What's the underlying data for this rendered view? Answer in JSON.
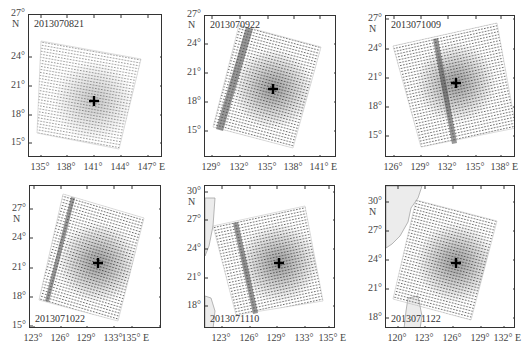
{
  "figure": {
    "panels": [
      {
        "id": "p1",
        "date": "2013070821",
        "date_pos": "top-left",
        "frame": {
          "left": 28,
          "top": 14,
          "width": 134,
          "height": 143
        },
        "y_ticks": [
          "27°",
          "24°",
          "21°",
          "18°",
          "15°"
        ],
        "y_tick_pos": [
          8,
          51,
          80,
          109,
          137
        ],
        "n_label": "N",
        "x_ticks": [
          "135°",
          "138°",
          "141°",
          "144°",
          "147°"
        ],
        "x_tick_pos": [
          40,
          66,
          93,
          120,
          147
        ],
        "e_label": "E",
        "swath": [
          [
            40,
            40
          ],
          [
            140,
            58
          ],
          [
            118,
            148
          ],
          [
            36,
            132
          ]
        ],
        "stripe": null,
        "center": [
          93,
          100
        ],
        "land": null
      },
      {
        "id": "p2",
        "date": "2013070922",
        "date_pos": "top-left",
        "frame": {
          "left": 204,
          "top": 15,
          "width": 132,
          "height": 142
        },
        "y_ticks": [
          "27°",
          "24°",
          "21°",
          "18°",
          "15°"
        ],
        "y_tick_pos": [
          9,
          38,
          67,
          96,
          125
        ],
        "n_label": "N",
        "x_ticks": [
          "129°",
          "132°",
          "135°",
          "138°",
          "141°"
        ],
        "x_tick_pos": [
          211,
          239,
          267,
          293,
          319
        ],
        "e_label": "E",
        "swath": [
          [
            238,
            24
          ],
          [
            320,
            46
          ],
          [
            292,
            147
          ],
          [
            212,
            126
          ]
        ],
        "stripe": [
          [
            245,
            26
          ],
          [
            252,
            28
          ],
          [
            222,
            130
          ],
          [
            215,
            128
          ]
        ],
        "center": [
          272,
          88
        ],
        "land": null
      },
      {
        "id": "p3",
        "date": "2013071009",
        "date_pos": "top-left",
        "frame": {
          "left": 385,
          "top": 15,
          "width": 130,
          "height": 142
        },
        "y_ticks": [
          "27°",
          "24°",
          "21°",
          "18°",
          "15°"
        ],
        "y_tick_pos": [
          13,
          43,
          72,
          101,
          130
        ],
        "n_label": "N",
        "x_ticks": [
          "126°",
          "129°",
          "132°",
          "135°",
          "138°"
        ],
        "x_tick_pos": [
          393,
          420,
          447,
          475,
          500
        ],
        "e_label": "E",
        "swath": [
          [
            392,
            45
          ],
          [
            496,
            22
          ],
          [
            515,
            127
          ],
          [
            420,
            146
          ]
        ],
        "stripe": [
          [
            432,
            38
          ],
          [
            437,
            37
          ],
          [
            456,
            142
          ],
          [
            451,
            143
          ]
        ],
        "center": [
          455,
          82
        ],
        "land": null
      },
      {
        "id": "p4",
        "date": "2013071022",
        "date_pos": "bottom-left",
        "frame": {
          "left": 29,
          "top": 185,
          "width": 132,
          "height": 143
        },
        "y_ticks": [
          "27°",
          "24°",
          "21°",
          "18°",
          "15°"
        ],
        "y_tick_pos": [
          203,
          232,
          262,
          291,
          320
        ],
        "n_label": "N",
        "x_ticks": [
          "123°",
          "126°",
          "129°",
          "133°",
          "135°"
        ],
        "x_tick_pos": [
          33,
          60,
          86,
          113,
          131
        ],
        "e_label": "E",
        "swath": [
          [
            62,
            193
          ],
          [
            143,
            217
          ],
          [
            117,
            320
          ],
          [
            38,
            299
          ]
        ],
        "stripe": [
          [
            70,
            196
          ],
          [
            74,
            197
          ],
          [
            48,
            301
          ],
          [
            44,
            300
          ]
        ],
        "center": [
          97,
          262
        ],
        "land": null
      },
      {
        "id": "p5",
        "date": "2013071110",
        "date_pos": "bottom-left",
        "frame": {
          "left": 204,
          "top": 185,
          "width": 131,
          "height": 143
        },
        "y_ticks": [
          "30°",
          "27°",
          "24°",
          "21°",
          "18°"
        ],
        "y_tick_pos": [
          186,
          214,
          243,
          272,
          300
        ],
        "n_label": "N",
        "x_ticks": [
          "123°",
          "126°",
          "129°",
          "133°",
          "135°"
        ],
        "x_tick_pos": [
          221,
          249,
          276,
          304,
          328
        ],
        "e_label": "E",
        "swath": [
          [
            212,
            225
          ],
          [
            304,
            205
          ],
          [
            322,
            300
          ],
          [
            235,
            314
          ]
        ],
        "stripe": [
          [
            232,
            222
          ],
          [
            237,
            221
          ],
          [
            257,
            312
          ],
          [
            252,
            313
          ]
        ],
        "center": [
          278,
          262
        ],
        "land": "taiwan-east"
      },
      {
        "id": "p6",
        "date": "2013071122",
        "date_pos": "bottom-left",
        "frame": {
          "left": 385,
          "top": 185,
          "width": 130,
          "height": 143
        },
        "y_ticks": [
          "30°",
          "27°",
          "24°",
          "21°",
          "18°"
        ],
        "y_tick_pos": [
          196,
          225,
          254,
          283,
          312
        ],
        "n_label": "N",
        "x_ticks": [
          "120°",
          "123°",
          "126°",
          "129°",
          "132°"
        ],
        "x_tick_pos": [
          397,
          424,
          452,
          480,
          503
        ],
        "e_label": "E",
        "swath": [
          [
            415,
            199
          ],
          [
            496,
            220
          ],
          [
            470,
            319
          ],
          [
            392,
            298
          ]
        ],
        "stripe": null,
        "center": [
          455,
          262
        ],
        "land": "china-coast"
      }
    ],
    "center_marker": "plus-sign"
  }
}
